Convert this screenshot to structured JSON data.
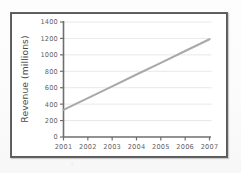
{
  "figure": {
    "frame_color": "#5a5a5a",
    "background_color": "#ffffff",
    "line_color": "#a9a9a9",
    "axis_color": "#6e6e6e",
    "grid_color": "#e2e2e2"
  },
  "chart_data": {
    "type": "line",
    "title": "",
    "xlabel": "",
    "ylabel": "Revenue (millions)",
    "x": [
      2001,
      2002,
      2003,
      2004,
      2005,
      2006,
      2007
    ],
    "categories": [
      "2001",
      "2002",
      "2003",
      "2004",
      "2005",
      "2006",
      "2007"
    ],
    "values": [
      330,
      473,
      617,
      760,
      903,
      1047,
      1190
    ],
    "series": [
      {
        "name": "Revenue",
        "values": [
          330,
          473,
          617,
          760,
          903,
          1047,
          1190
        ]
      }
    ],
    "xlim": [
      2001,
      2007
    ],
    "ylim": [
      0,
      1400
    ],
    "ytick_labels": [
      "1400",
      "1200",
      "1000",
      "800",
      "600",
      "400",
      "200",
      "0"
    ],
    "ytick_values": [
      1400,
      1200,
      1000,
      800,
      600,
      400,
      200,
      0
    ],
    "xtick_labels": [
      "2001",
      "2002",
      "2003",
      "2004",
      "2005",
      "2006",
      "2007"
    ],
    "grid": true,
    "grid_axis": "y",
    "legend": false,
    "legend_position": "none",
    "annotations": []
  }
}
